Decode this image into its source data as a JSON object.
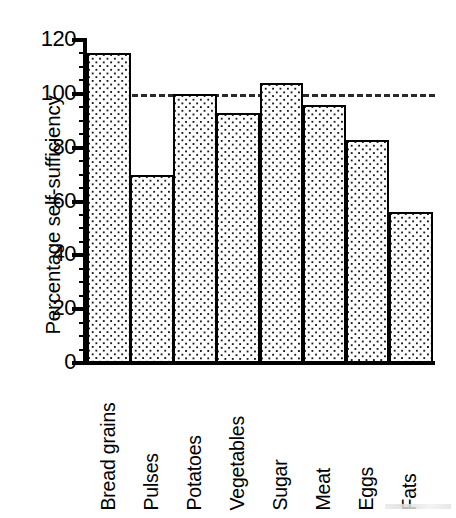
{
  "chart_data": {
    "type": "bar",
    "title": "",
    "xlabel": "",
    "ylabel": "Percentage self-sufficiency",
    "categories": [
      "Bread grains",
      "Pulses",
      "Potatoes",
      "Vegetables",
      "Sugar",
      "Meat",
      "Eggs",
      "Fats"
    ],
    "values": [
      115,
      70,
      100,
      93,
      104,
      96,
      83,
      56
    ],
    "ylim": [
      0,
      120
    ],
    "ytick_labels": [
      "0",
      "20",
      "40",
      "60",
      "80",
      "100",
      "120"
    ],
    "ytick_values": [
      0,
      20,
      40,
      60,
      80,
      100,
      120
    ],
    "yminor_step": 5,
    "grid": false,
    "legend": "none",
    "reference_line": {
      "value": 100,
      "style": "dashed",
      "color": "#2a2a2a"
    },
    "bar_style": {
      "fill": "dotted-stipple",
      "fill_color": "#ffffff",
      "dot_color": "#1a1a1a",
      "edge_color": "#000000",
      "gap": 0
    },
    "axis_color": "#000000",
    "background": "#ffffff"
  }
}
